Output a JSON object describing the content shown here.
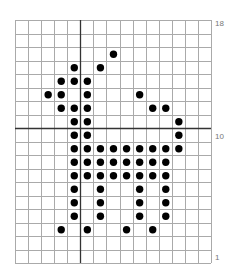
{
  "chart_data": {
    "type": "dot-grid pattern",
    "title": "",
    "columns": 15,
    "rows": 18,
    "row_labels": [
      {
        "row": 18,
        "label": "18"
      },
      {
        "row": 10,
        "label": "10"
      },
      {
        "row": 1,
        "label": "1"
      }
    ],
    "center_lines": {
      "vertical_after_column": 5,
      "horizontal_above_row": 10
    },
    "dots_by_row_from_top": [
      [],
      [],
      [
        8
      ],
      [
        5,
        7
      ],
      [
        4,
        5,
        6
      ],
      [
        3,
        4,
        6,
        10
      ],
      [
        4,
        5,
        6,
        11,
        12
      ],
      [
        5,
        6,
        13
      ],
      [
        5,
        6,
        13
      ],
      [
        5,
        6,
        7,
        8,
        9,
        10,
        11,
        12,
        13
      ],
      [
        5,
        6,
        7,
        8,
        9,
        10,
        11,
        12
      ],
      [
        5,
        6,
        7,
        8,
        9,
        10,
        11,
        12
      ],
      [
        5,
        7,
        10,
        12
      ],
      [
        5,
        7,
        10,
        12
      ],
      [
        5,
        7,
        10,
        12
      ],
      [
        4,
        6,
        9,
        11
      ],
      [],
      []
    ]
  },
  "labels": {
    "top": "18",
    "middle": "10",
    "bottom": "1"
  },
  "colors": {
    "grid": "#aaaaaa",
    "center": "#333333",
    "dot": "#000000"
  }
}
